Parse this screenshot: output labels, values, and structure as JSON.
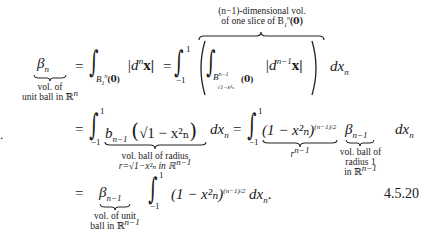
{
  "equation": {
    "number": "4.5.20",
    "lhs": {
      "symbol": "β",
      "subscript": "n",
      "note_line1": "vol. of",
      "note_line2": "unit ball in ℝ",
      "note_sup": "n"
    },
    "line1": {
      "equals": "=",
      "int1_lower": "B",
      "int1_lower_sub": "1",
      "int1_lower_sup": "n",
      "int1_lower_arg": "(𝟎)",
      "integrand1": "|d",
      "integrand1_sup": "n",
      "integrand1_x": "x|",
      "equals2": "=",
      "int2_upper": "1",
      "int2_lower": "−1",
      "inner_int_lower": "B",
      "inner_int_lower_sup": "n−1",
      "inner_int_lower_sub": "√1−x²ₙ",
      "inner_int_lower_arg": "(𝟎)",
      "inner_integrand": "|d",
      "inner_integrand_sup": "n−1",
      "inner_integrand_x": "x|",
      "dx": "dx",
      "dx_sub": "n",
      "overbrace_note_line1": "(n−1)-dimensional vol.",
      "overbrace_note_line2": "of one slice of B",
      "overbrace_note_sub": "1",
      "overbrace_note_sup": "n",
      "overbrace_note_arg": "(𝟎)"
    },
    "line2": {
      "equals": "=",
      "int_upper": "1",
      "int_lower": "−1",
      "term1": "b",
      "term1_sub": "n−1",
      "term1_arg": "√1 − x²ₙ",
      "term1_note_line1": "vol. ball of radius",
      "term1_note_line2": "r=√1−x²ₙ in ℝ",
      "term1_note_sup": "n−1",
      "dx": "dx",
      "dx_sub": "n",
      "equals2": "=",
      "int2_upper": "1",
      "int2_lower": "−1",
      "term2": "(1 − x²ₙ)",
      "term2_sup": "(n−1)/2",
      "term2_note": "r",
      "term2_note_sup": "n−1",
      "term3": "β",
      "term3_sub": "n−1",
      "term3_note_line1": "vol. ball of",
      "term3_note_line2": "radius 1",
      "term3_note_line3": "in ℝ",
      "term3_note_sup": "n−1",
      "dx2": "dx",
      "dx2_sub": "n"
    },
    "line3": {
      "equals": "=",
      "term1": "β",
      "term1_sub": "n−1",
      "term1_note_line1": "vol. of unit",
      "term1_note_line2": "ball in ℝ",
      "term1_note_sup": "n−1",
      "int_upper": "1",
      "int_lower": "−1",
      "integrand": "(1 − x²ₙ)",
      "integrand_sup": "(n−1)/2",
      "dx": "dx",
      "dx_sub": "n",
      "period": "."
    },
    "stray_mark": "."
  }
}
